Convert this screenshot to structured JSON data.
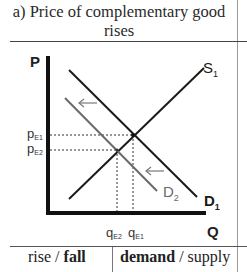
{
  "title": {
    "line1": "a) Price of complementary good",
    "line2": "rises"
  },
  "diagram": {
    "y_axis_label": "P",
    "x_axis_label": "Q",
    "curves": [
      {
        "name": "S",
        "sub": "1",
        "type": "supply",
        "color": "#1a1a1a"
      },
      {
        "name": "D",
        "sub": "1",
        "type": "demand",
        "color": "#1a1a1a"
      },
      {
        "name": "D",
        "sub": "2",
        "type": "demand",
        "color": "#6a6a6a"
      }
    ],
    "price_labels": [
      {
        "main": "p",
        "sub": "E1"
      },
      {
        "main": "p",
        "sub": "E2"
      }
    ],
    "quantity_labels": [
      {
        "main": "q",
        "sub": "E2"
      },
      {
        "main": "q",
        "sub": "E1"
      }
    ],
    "shift_arrows": [
      "left",
      "left"
    ]
  },
  "footer": {
    "direction_rise": "rise",
    "separator1": " / ",
    "direction_fall": "fall",
    "curve_demand": "demand",
    "separator2": " / ",
    "curve_supply": "supply"
  }
}
